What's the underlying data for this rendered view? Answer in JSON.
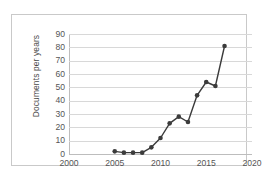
{
  "chart_data": {
    "type": "line",
    "title": "",
    "xlabel": "",
    "ylabel": "Documents per years",
    "x": [
      2005,
      2006,
      2007,
      2008,
      2009,
      2010,
      2011,
      2012,
      2013,
      2014,
      2015,
      2016,
      2017
    ],
    "values": [
      2,
      1,
      1,
      1,
      5,
      12,
      23,
      28,
      24,
      44,
      54,
      51,
      81
    ],
    "series": [
      {
        "name": "Documents per years",
        "values": [
          2,
          1,
          1,
          1,
          5,
          12,
          23,
          28,
          24,
          44,
          54,
          51,
          81
        ]
      }
    ],
    "xlim": [
      2000,
      2020
    ],
    "ylim": [
      0,
      90
    ],
    "xticks": [
      "2000",
      "2005",
      "2010",
      "2015",
      "2020"
    ],
    "xtick_values": [
      2000,
      2005,
      2010,
      2015,
      2020
    ],
    "yticks": [
      "0",
      "10",
      "20",
      "30",
      "40",
      "50",
      "60",
      "70",
      "80",
      "90"
    ],
    "ytick_values": [
      0,
      10,
      20,
      30,
      40,
      50,
      60,
      70,
      80,
      90
    ],
    "grid": "horizontal",
    "legend": "none",
    "marker": "circle",
    "line_color": "#3b3b3b",
    "marker_color": "#3b3b3b",
    "grid_color": "#d8d8d8",
    "axis_color": "#bdbdbd",
    "tick_label_color": "#555555",
    "background_color": "#ffffff",
    "frame_color": "#c9c9c9"
  }
}
